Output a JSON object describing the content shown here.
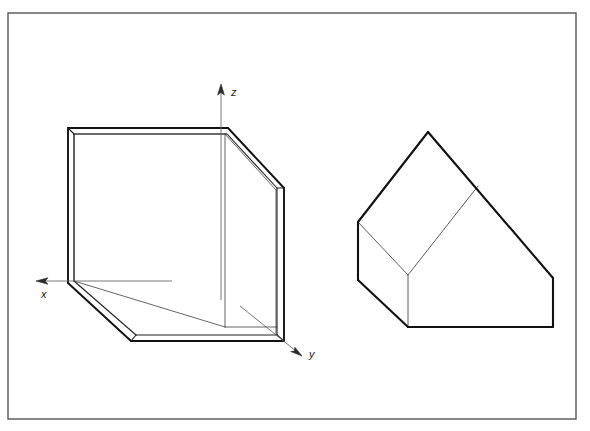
{
  "page": {
    "width": 590,
    "height": 431,
    "background": "#ffffff",
    "ink_color": "#1a1a1a",
    "thin_ink_color": "#5a5a5a"
  },
  "frame": {
    "name": "drawing-border",
    "x": 8,
    "y": 13,
    "width": 568,
    "height": 406,
    "stroke": "#555555",
    "stroke_width": 1.4
  },
  "axes": {
    "origin": {
      "x": 63,
      "y": 281
    },
    "items": [
      {
        "id": "z",
        "label": "z",
        "direction": "up",
        "line": {
          "x1": 221,
          "y1": 296,
          "x2": 221,
          "y2": 88
        },
        "arrow_tip": {
          "x": 221,
          "y": 84
        },
        "label_pos": {
          "x": 231,
          "y": 95
        }
      },
      {
        "id": "x",
        "label": "x",
        "direction": "left",
        "line": {
          "x1": 172,
          "y1": 281,
          "x2": 40,
          "y2": 281
        },
        "arrow_tip": {
          "x": 36,
          "y": 281
        },
        "label_pos": {
          "x": 41,
          "y": 297
        }
      },
      {
        "id": "y",
        "label": "y",
        "direction": "down-right",
        "line": {
          "x1": 238,
          "y1": 304,
          "x2": 297,
          "y2": 352
        },
        "arrow_tip": {
          "x": 301,
          "y": 355
        },
        "label_pos": {
          "x": 308,
          "y": 356
        }
      }
    ]
  },
  "figures": [
    {
      "id": "open-box",
      "name": "open-box-corner-figure",
      "caption": "Open rectangular box shown as room corner in axonometric projection",
      "outline": "M 68,128 L 228,128 L 284,188 L 284,341 L 131,341 L 68,283 Z",
      "paths": {
        "outer_silhouette": "M 68,128 L 228,128 L 284,188 L 284,341 L 131,341 L 68,283 Z",
        "top_wall_inner": "M 74,134 L 225,134 L 277,190 L 277,196",
        "back_wall_right_edge": "M 225,134 L 225,327",
        "left_wall_inner_vertical": "M 74,134 L 74,280",
        "floor_back_edge": "M 74,281 L 225,327",
        "floor_right_edge": "M 225,327 L 277,327",
        "floor_front_edge": "M 136,335 L 277,335",
        "floor_front_left": "M 74,281 L 136,335",
        "right_panel_inner": "M 277,196 L 277,334",
        "slant_inner": "M 225,134 L 277,190"
      }
    },
    {
      "id": "house-solid",
      "name": "house-shaped-solid-figure",
      "caption": "House-shaped prism solid in axonometric projection",
      "outline": "M 428,132 L 553,278 L 553,327 L 408,327 L 358,280 L 358,222 Z",
      "paths": {
        "roof_ridge_left": "M 428,132 L 358,222",
        "roof_slope_right": "M 428,132 L 553,278",
        "right_vertical": "M 553,278 L 553,327",
        "bottom_edge": "M 553,327 L 408,327",
        "left_lower_diagonal": "M 408,327 L 358,280",
        "left_vertical": "M 358,280 L 358,222",
        "interior_eave": "M 358,222 L 408,275",
        "interior_ridge": "M 408,275 L 478,186",
        "interior_vertical": "M 408,275 L 408,327"
      }
    }
  ]
}
